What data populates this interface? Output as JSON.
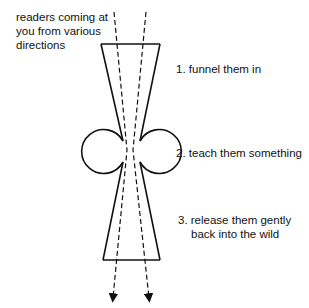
{
  "diagram": {
    "intro_label": "readers coming at you from various directions",
    "steps": [
      {
        "number": "1.",
        "text": "funnel them in"
      },
      {
        "number": "2.",
        "text": "teach them something"
      },
      {
        "number": "3.",
        "text": "release them gently",
        "text_line2": "back into the wild"
      }
    ],
    "colors": {
      "stroke": "#111111",
      "background": "#ffffff"
    }
  },
  "labels": {
    "intro_line1": "readers coming at",
    "intro_line2": "you from various",
    "intro_line3": "directions",
    "step1": "1. funnel them in",
    "step2": "2. teach them something",
    "step3_line1": "3. release them gently",
    "step3_line2": "back into the wild"
  }
}
